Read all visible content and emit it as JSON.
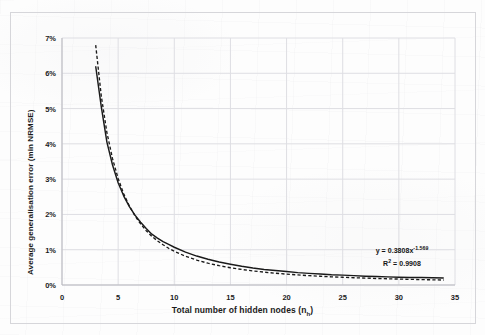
{
  "chart_data": {
    "type": "line",
    "title": "",
    "xlabel": "Total number of hidden nodes (n_h)",
    "xlabel_main": "Total number of hidden nodes (n",
    "xlabel_sub": "h",
    "xlabel_close": ")",
    "ylabel": "Average generalisation error (min NRMSE)",
    "xlim": [
      0,
      35
    ],
    "ylim": [
      0,
      0.07
    ],
    "grid": true,
    "legend": "none",
    "x_ticks": [
      "0",
      "5",
      "10",
      "15",
      "20",
      "25",
      "30",
      "35"
    ],
    "x_tick_values": [
      0,
      5,
      10,
      15,
      20,
      25,
      30,
      35
    ],
    "y_ticks": [
      "0%",
      "1%",
      "2%",
      "3%",
      "4%",
      "5%",
      "6%",
      "7%"
    ],
    "y_tick_values": [
      0,
      1,
      2,
      3,
      4,
      5,
      6,
      7
    ],
    "series": [
      {
        "name": "Average generalisation error (min NRMSE)",
        "style": "solid",
        "color": "#1a1a1a",
        "x": [
          3,
          3.5,
          4,
          4.5,
          5,
          5.5,
          6,
          6.5,
          7,
          7.5,
          8,
          8.5,
          9,
          9.5,
          10,
          11,
          12,
          13,
          14,
          15,
          16,
          17,
          18,
          19,
          20,
          21,
          22,
          23,
          24,
          25,
          26,
          27,
          28,
          29,
          30,
          31,
          32,
          33,
          34
        ],
        "values": [
          6.2,
          5.05,
          4.05,
          3.4,
          2.9,
          2.52,
          2.22,
          1.98,
          1.78,
          1.6,
          1.44,
          1.33,
          1.23,
          1.15,
          1.07,
          0.93,
          0.82,
          0.73,
          0.65,
          0.59,
          0.53,
          0.48,
          0.44,
          0.41,
          0.38,
          0.35,
          0.33,
          0.31,
          0.29,
          0.28,
          0.265,
          0.25,
          0.24,
          0.23,
          0.22,
          0.215,
          0.21,
          0.205,
          0.2
        ]
      },
      {
        "name": "Power trendline",
        "style": "dashed",
        "color": "#1a1a1a",
        "x": [
          3,
          3.5,
          4,
          4.5,
          5,
          5.5,
          6,
          6.5,
          7,
          7.5,
          8,
          8.5,
          9,
          9.5,
          10,
          11,
          12,
          13,
          14,
          15,
          16,
          17,
          18,
          19,
          20,
          21,
          22,
          23,
          24,
          25,
          26,
          27,
          28,
          29,
          30,
          31,
          32,
          33,
          34
        ],
        "values": [
          6.8,
          5.35,
          4.32,
          3.58,
          3.02,
          2.58,
          2.24,
          1.96,
          1.73,
          1.54,
          1.38,
          1.25,
          1.14,
          1.04,
          0.955,
          0.815,
          0.705,
          0.618,
          0.547,
          0.489,
          0.44,
          0.399,
          0.364,
          0.334,
          0.308,
          0.285,
          0.265,
          0.248,
          0.232,
          0.219,
          0.206,
          0.195,
          0.185,
          0.176,
          0.168,
          0.16,
          0.153,
          0.147,
          0.141
        ]
      }
    ],
    "annotations": {
      "equation_prefix": "y = 0.3808x",
      "equation_exponent": "-1.569",
      "r_squared_label": "R",
      "r_squared_sup": "2",
      "r_squared_value": " = 0.9908"
    }
  }
}
